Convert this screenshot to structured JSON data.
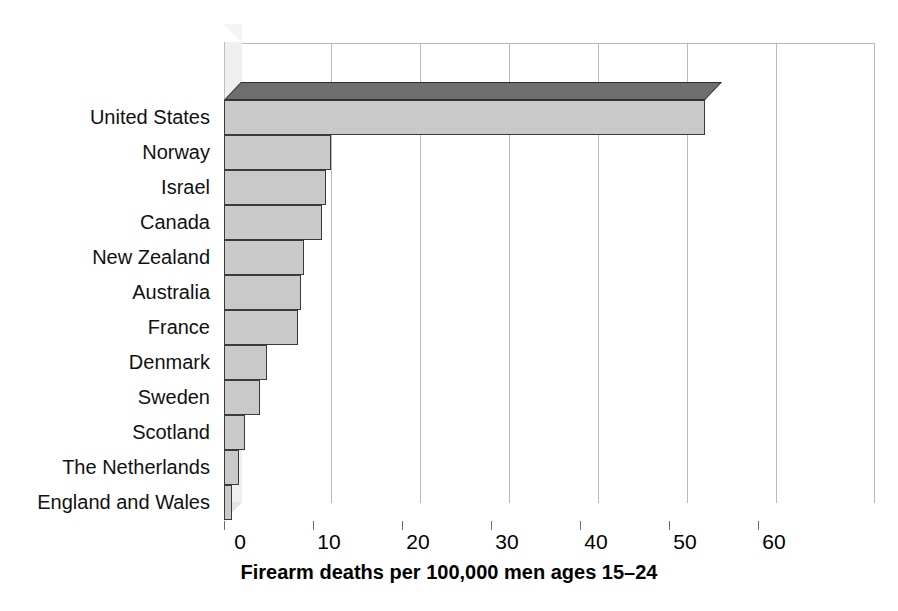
{
  "chart_data": {
    "type": "bar",
    "orientation": "horizontal",
    "title": "",
    "subtitle": "",
    "xlabel": "Firearm deaths per 100,000 men ages 15–24",
    "ylabel": "",
    "categories": [
      "United States",
      "Norway",
      "Israel",
      "Canada",
      "New Zealand",
      "Australia",
      "France",
      "Denmark",
      "Sweden",
      "Scotland",
      "The Netherlands",
      "England and Wales"
    ],
    "values": [
      54.0,
      12.0,
      11.5,
      11.0,
      9.0,
      8.7,
      8.3,
      4.8,
      4.0,
      2.4,
      1.7,
      0.9
    ],
    "xlim": [
      0,
      60
    ],
    "xticks": [
      0,
      10,
      20,
      30,
      40,
      50,
      60
    ],
    "xtick_labels": [
      "0",
      "10",
      "20",
      "30",
      "40",
      "50",
      "60"
    ],
    "grid": true,
    "grid_axis": "x",
    "legend": false,
    "style": "3d-bar",
    "bar_fill_color": "#c9c9c9",
    "bar_edge_color": "#3a3a3a",
    "bar_top_color": "#6e6e6e",
    "grid_color": "#b9b9b9",
    "background_color": "#ffffff",
    "text_color": "#000000"
  },
  "axis": {
    "title": "Firearm deaths per 100,000 men ages 15–24"
  }
}
